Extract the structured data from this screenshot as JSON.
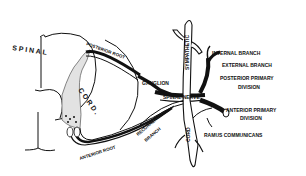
{
  "diagram": {
    "colors": {
      "ink": "#111111",
      "background": "#ffffff",
      "fill_gray": "#d8d8d8"
    },
    "labels": {
      "spinal": "S P I N A L",
      "cord": "C O R D .",
      "posterior_root": "POSTERIOR ROOT",
      "ganglion": "GANGLION",
      "spinal_nerve": "SPINAL NERVE",
      "sympathetic": "SYMPATHETIC",
      "sympathetic_cord": "CORD",
      "internal_branch": "INTERNAL BRANCH",
      "external_branch": "EXTERNAL BRANCH",
      "posterior_primary_1": "POSTERIOR PRIMARY",
      "posterior_primary_2": "DIVISION",
      "anterior_primary_1": "ANTERIOR PRIMARY",
      "anterior_primary_2": "DIVISION",
      "ramus_communicans": "RAMUS COMMUNICANS",
      "recurrent_1": "RECURRENT",
      "recurrent_2": "BRANCH",
      "anterior_root": "ANTERIOR ROOT"
    }
  }
}
